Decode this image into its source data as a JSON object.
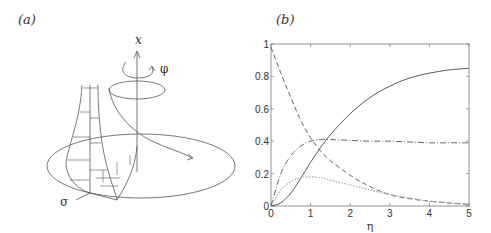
{
  "figure": {
    "panel_a_label": "(a)",
    "panel_b_label": "(b)",
    "diagram_labels": {
      "axis_x": "x",
      "azimuth": "φ",
      "radial": "σ"
    }
  },
  "chart_data": {
    "type": "line",
    "title": "",
    "xlabel": "η",
    "ylabel": "",
    "xlim": [
      0,
      5
    ],
    "ylim": [
      0,
      1
    ],
    "xticks": [
      "0",
      "1",
      "2",
      "3",
      "4",
      "5"
    ],
    "yticks": [
      "0",
      "0.2",
      "0.4",
      "0.6",
      "0.8",
      "1"
    ],
    "grid": false,
    "legend": "none",
    "series": [
      {
        "name": "solid",
        "style": "solid",
        "color": "#444444",
        "x": [
          0,
          0.25,
          0.5,
          0.75,
          1,
          1.25,
          1.5,
          2,
          2.5,
          3,
          3.5,
          4,
          4.5,
          5
        ],
        "y": [
          0,
          0.02,
          0.08,
          0.17,
          0.27,
          0.36,
          0.44,
          0.57,
          0.67,
          0.74,
          0.79,
          0.82,
          0.84,
          0.85
        ]
      },
      {
        "name": "dashed",
        "style": "dashed",
        "color": "#555555",
        "x": [
          0,
          0.25,
          0.5,
          0.75,
          1,
          1.25,
          1.5,
          2,
          2.5,
          3,
          3.5,
          4,
          4.5,
          5
        ],
        "y": [
          0.98,
          0.82,
          0.67,
          0.53,
          0.42,
          0.34,
          0.28,
          0.19,
          0.12,
          0.07,
          0.045,
          0.03,
          0.018,
          0.01
        ]
      },
      {
        "name": "dash-dot",
        "style": "dashdot",
        "color": "#555555",
        "x": [
          0,
          0.25,
          0.5,
          0.75,
          1,
          1.25,
          1.5,
          2,
          2.5,
          3,
          3.5,
          4,
          4.5,
          5
        ],
        "y": [
          0,
          0.2,
          0.31,
          0.37,
          0.4,
          0.41,
          0.41,
          0.405,
          0.4,
          0.4,
          0.395,
          0.39,
          0.39,
          0.39
        ]
      },
      {
        "name": "dotted-light",
        "style": "dotted",
        "color": "#aaaaaa",
        "x": [
          0,
          0.25,
          0.5,
          0.75,
          1,
          1.25,
          1.5,
          2,
          2.5,
          3,
          3.5,
          4,
          4.5,
          5
        ],
        "y": [
          0,
          0.1,
          0.15,
          0.175,
          0.18,
          0.175,
          0.16,
          0.13,
          0.1,
          0.07,
          0.05,
          0.03,
          0.02,
          0.01
        ]
      }
    ]
  }
}
